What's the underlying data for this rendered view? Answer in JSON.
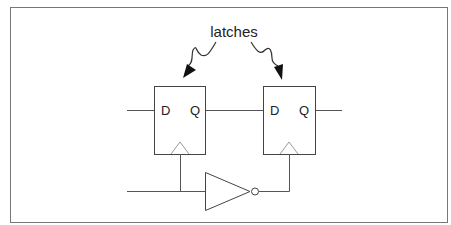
{
  "diagram": {
    "annotation": "latches",
    "latch1": {
      "d_label": "D",
      "q_label": "Q"
    },
    "latch2": {
      "d_label": "D",
      "q_label": "Q"
    },
    "colors": {
      "line": "#555555",
      "box": "#444444",
      "text": "#222222",
      "border": "#777777"
    }
  }
}
